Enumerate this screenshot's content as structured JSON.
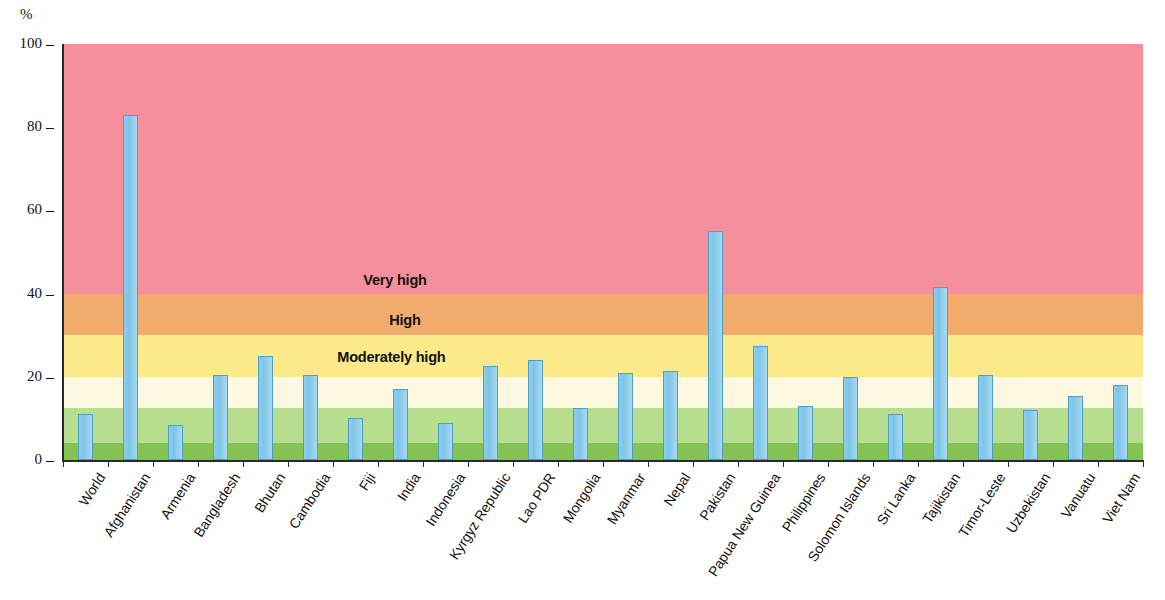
{
  "chart_data": {
    "type": "bar",
    "title": "",
    "subtitle": "",
    "xlabel": "",
    "ylabel": "%",
    "unit_label": "%",
    "ylim": [
      0,
      100
    ],
    "y_ticks": [
      0,
      20,
      40,
      60,
      80,
      100
    ],
    "grid": false,
    "legend_position": "inside-bands",
    "series_name": "",
    "bar_color": "#7ec4e8",
    "categories": [
      "World",
      "Afghanistan",
      "Armenia",
      "Bangladesh",
      "Bhutan",
      "Cambodia",
      "Fiji",
      "India",
      "Indonesia",
      "Kyrgyz Republic",
      "Lao PDR",
      "Mongolia",
      "Myanmar",
      "Nepal",
      "Pakistan",
      "Papua New Guinea",
      "Philippines",
      "Solomon Islands",
      "Sri Lanka",
      "Tajikistan",
      "Timor-Leste",
      "Uzbekistan",
      "Vanuatu",
      "Viet Nam"
    ],
    "values": [
      11,
      83,
      8.5,
      20.5,
      25,
      20.5,
      10,
      17,
      9,
      22.5,
      24,
      12.5,
      21,
      21.5,
      55,
      27.5,
      13,
      20,
      11,
      41.5,
      20.5,
      12,
      15.5,
      18
    ],
    "bands": [
      {
        "name": "Very high",
        "label": "Very high",
        "from": 40,
        "to": 100,
        "color": "#f48f9b"
      },
      {
        "name": "High",
        "label": "High",
        "from": 30,
        "to": 40,
        "color": "#f0ab6d"
      },
      {
        "name": "Moderately high",
        "label": "Moderately high",
        "from": 20,
        "to": 30,
        "color": "#fbe98a"
      },
      {
        "name": "Moderate",
        "label": "",
        "from": 12.5,
        "to": 20,
        "color": "#fdf8e0"
      },
      {
        "name": "Low",
        "label": "",
        "from": 4,
        "to": 12.5,
        "color": "#b7dd8e"
      },
      {
        "name": "Very low",
        "label": "",
        "from": 0,
        "to": 4,
        "color": "#84c254"
      }
    ],
    "band_captions": [
      {
        "label": "Very high",
        "x_pct": 27.8,
        "value": 43
      },
      {
        "label": "High",
        "x_pct": 30.2,
        "value": 33.5
      },
      {
        "label": "Moderately high",
        "x_pct": 25.4,
        "value": 24.5
      }
    ]
  }
}
